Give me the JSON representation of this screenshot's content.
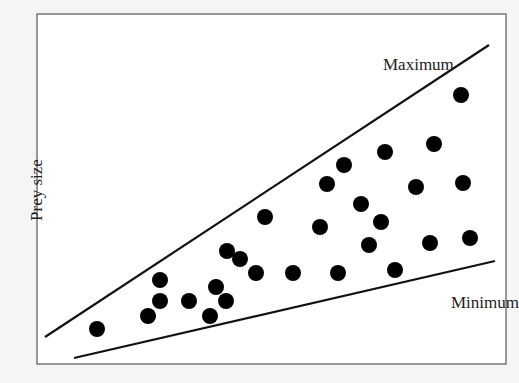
{
  "chart_data": {
    "type": "scatter",
    "title": "",
    "xlabel": "",
    "ylabel": "Prey size",
    "grid": false,
    "legend": null,
    "axes_box_px": {
      "left": 37,
      "top": 14,
      "right": 506,
      "bottom": 364
    },
    "annotations": [
      {
        "text": "Maximum",
        "x_px": 383,
        "y_px": 70
      },
      {
        "text": "Minimum",
        "x_px": 451,
        "y_px": 308
      }
    ],
    "lines": [
      {
        "name": "Maximum",
        "x1_px": 45,
        "y1_px": 337,
        "x2_px": 489,
        "y2_px": 45
      },
      {
        "name": "Minimum",
        "x1_px": 74,
        "y1_px": 358,
        "x2_px": 495,
        "y2_px": 261
      }
    ],
    "points_px": [
      [
        97,
        329
      ],
      [
        148,
        316
      ],
      [
        160,
        280
      ],
      [
        160,
        301
      ],
      [
        189,
        301
      ],
      [
        210,
        316
      ],
      [
        216,
        287
      ],
      [
        226,
        301
      ],
      [
        227,
        251
      ],
      [
        240,
        259
      ],
      [
        256,
        273
      ],
      [
        265,
        217
      ],
      [
        293,
        273
      ],
      [
        320,
        227
      ],
      [
        327,
        184
      ],
      [
        344,
        165
      ],
      [
        338,
        273
      ],
      [
        361,
        204
      ],
      [
        369,
        245
      ],
      [
        381,
        222
      ],
      [
        385,
        152
      ],
      [
        395,
        270
      ],
      [
        416,
        187
      ],
      [
        430,
        243
      ],
      [
        434,
        144
      ],
      [
        463,
        183
      ],
      [
        470,
        238
      ],
      [
        461,
        95
      ]
    ]
  }
}
